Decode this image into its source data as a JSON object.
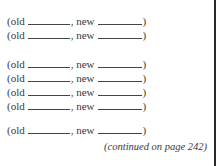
{
  "rows": [
    {
      "old_label": "(old",
      "new_label": ", new",
      "close": ")"
    },
    {
      "old_label": "(old",
      "new_label": ", new",
      "close": ")"
    },
    {
      "old_label": "(old",
      "new_label": ", new",
      "close": ")"
    },
    {
      "old_label": "(old",
      "new_label": ", new",
      "close": ")"
    },
    {
      "old_label": "(old",
      "new_label": ", new",
      "close": ")"
    },
    {
      "old_label": "(old",
      "new_label": ", new",
      "close": ")"
    },
    {
      "old_label": "(old",
      "new_label": ", new",
      "close": ")"
    }
  ],
  "caption": "(continued on page 242)"
}
